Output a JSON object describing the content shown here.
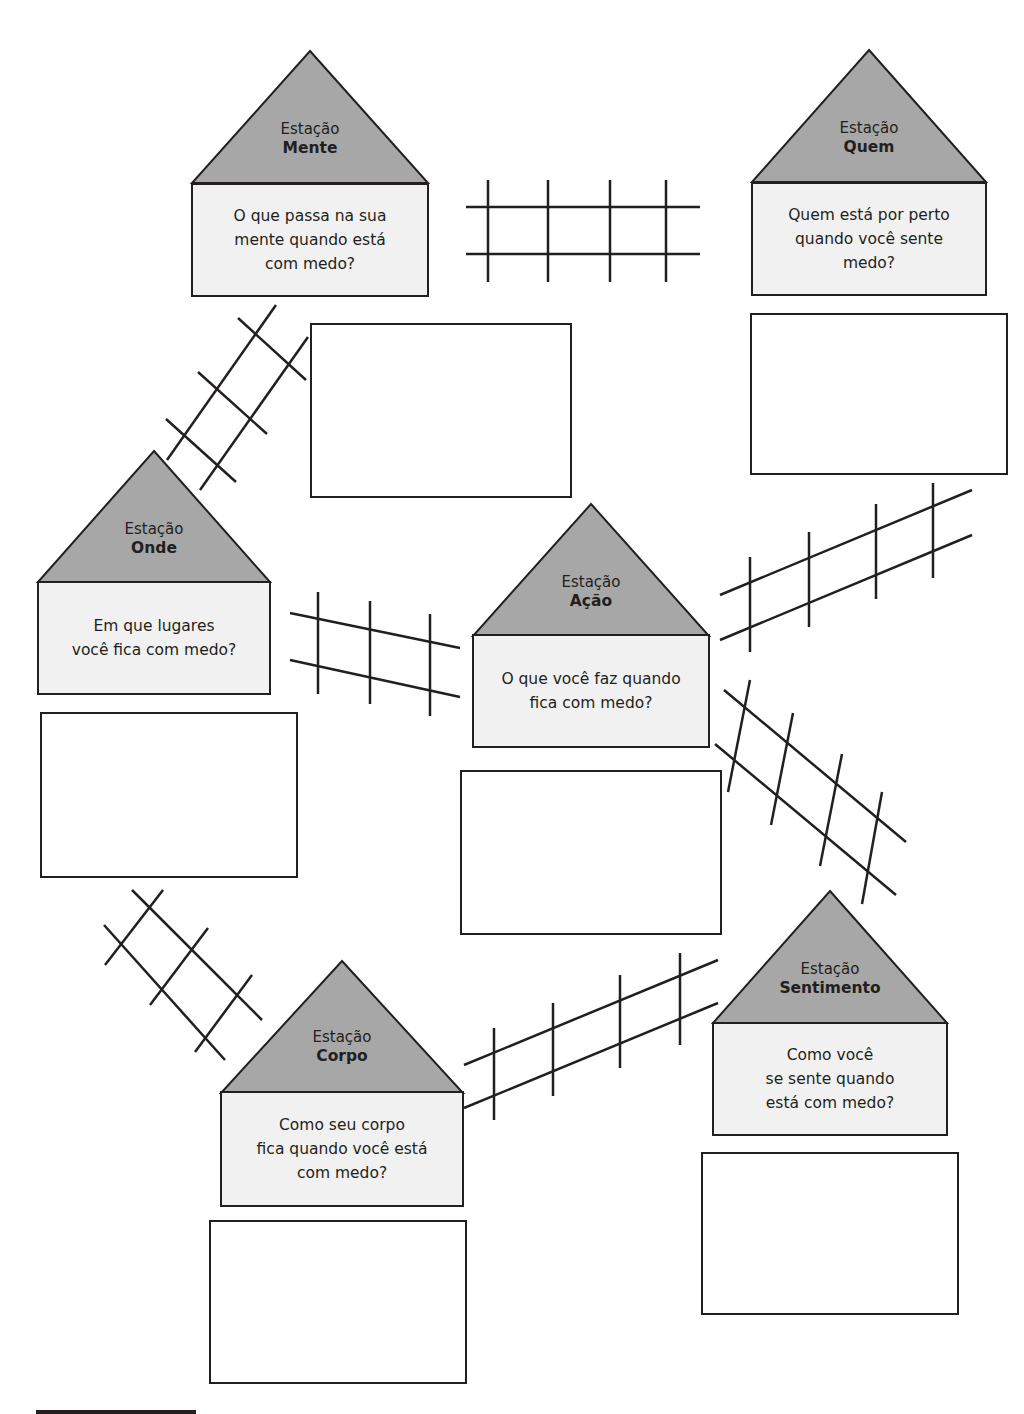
{
  "stations": [
    {
      "id": "mente",
      "label": "Estação",
      "name": "Mente",
      "question": "O que passa na sua\nmente quando está\ncom medo?"
    },
    {
      "id": "quem",
      "label": "Estação",
      "name": "Quem",
      "question": "Quem está por perto\nquando você sente\nmedo?"
    },
    {
      "id": "onde",
      "label": "Estação",
      "name": "Onde",
      "question": "Em que lugares\nvocê fica com medo?"
    },
    {
      "id": "acao",
      "label": "Estação",
      "name": "Ação",
      "question": "O que você faz quando\nfica com medo?"
    },
    {
      "id": "corpo",
      "label": "Estação",
      "name": "Corpo",
      "question": "Como seu corpo\nfica quando você está\ncom medo?"
    },
    {
      "id": "sentimento",
      "label": "Estação",
      "name": "Sentimento",
      "question": "Como você\nse sente quando\nestá com medo?"
    }
  ],
  "colors": {
    "roof": "#a7a7a7",
    "body": "#f1f1f1",
    "line": "#231f20"
  }
}
